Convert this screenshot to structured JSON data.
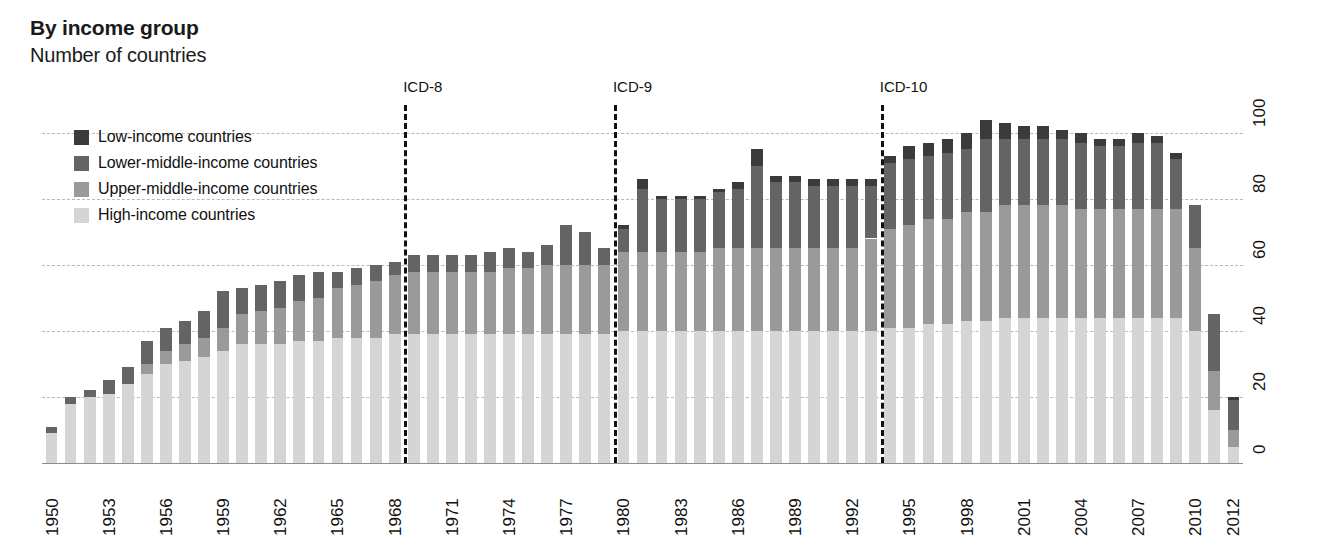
{
  "header": {
    "title": "By income group",
    "subtitle": "Number of countries"
  },
  "legend": {
    "position": "top-left-inside",
    "items": [
      {
        "label": "Low-income countries",
        "color": "#3b3b3b",
        "key": "low"
      },
      {
        "label": "Lower-middle-income countries",
        "color": "#646464",
        "key": "lower_middle"
      },
      {
        "label": "Upper-middle-income countries",
        "color": "#9a9a9a",
        "key": "upper_middle"
      },
      {
        "label": "High-income countries",
        "color": "#d5d5d5",
        "key": "high"
      }
    ]
  },
  "annotations": [
    {
      "label": "ICD-8",
      "year": 1968.5
    },
    {
      "label": "ICD-9",
      "year": 1979.5
    },
    {
      "label": "ICD-10",
      "year": 1993.5
    }
  ],
  "chart_data": {
    "type": "bar",
    "stacked": true,
    "title": "By income group",
    "subtitle": "Number of countries",
    "xlabel": "",
    "ylabel": "Number of countries",
    "ylim": [
      0,
      106
    ],
    "yticks": [
      0,
      20,
      40,
      60,
      80,
      100
    ],
    "ytick_labels": [
      "0",
      "20",
      "40",
      "60",
      "80",
      "100"
    ],
    "grid": "horizontal-dashed",
    "x_tick_step": 3,
    "x_tick_years": [
      1950,
      1953,
      1956,
      1959,
      1962,
      1965,
      1968,
      1971,
      1974,
      1977,
      1980,
      1983,
      1986,
      1989,
      1992,
      1995,
      1998,
      2001,
      2004,
      2007,
      2010,
      2012
    ],
    "categories": [
      1950,
      1951,
      1952,
      1953,
      1954,
      1955,
      1956,
      1957,
      1958,
      1959,
      1960,
      1961,
      1962,
      1963,
      1964,
      1965,
      1966,
      1967,
      1968,
      1969,
      1970,
      1971,
      1972,
      1973,
      1974,
      1975,
      1976,
      1977,
      1978,
      1979,
      1980,
      1981,
      1982,
      1983,
      1984,
      1985,
      1986,
      1987,
      1988,
      1989,
      1990,
      1991,
      1992,
      1993,
      1994,
      1995,
      1996,
      1997,
      1998,
      1999,
      2000,
      2001,
      2002,
      2003,
      2004,
      2005,
      2006,
      2007,
      2008,
      2009,
      2010,
      2011,
      2012
    ],
    "series": [
      {
        "name": "High-income countries",
        "color": "#d5d5d5",
        "values": [
          9,
          18,
          20,
          21,
          24,
          27,
          30,
          31,
          32,
          34,
          36,
          36,
          36,
          37,
          37,
          38,
          38,
          38,
          39,
          39,
          39,
          39,
          39,
          39,
          39,
          39,
          39,
          39,
          39,
          39,
          40,
          40,
          40,
          40,
          40,
          40,
          40,
          40,
          40,
          40,
          40,
          40,
          40,
          40,
          41,
          41,
          42,
          42,
          43,
          43,
          44,
          44,
          44,
          44,
          44,
          44,
          44,
          44,
          44,
          44,
          40,
          16,
          5
        ]
      },
      {
        "name": "Upper-middle-income countries",
        "color": "#9a9a9a",
        "values": [
          0,
          0,
          0,
          0,
          0,
          3,
          4,
          5,
          6,
          7,
          9,
          10,
          11,
          12,
          13,
          15,
          16,
          17,
          18,
          19,
          19,
          19,
          19,
          19,
          20,
          20,
          21,
          21,
          21,
          21,
          24,
          24,
          24,
          24,
          24,
          25,
          25,
          25,
          25,
          25,
          25,
          25,
          25,
          28,
          30,
          31,
          32,
          32,
          33,
          33,
          34,
          34,
          34,
          34,
          33,
          33,
          33,
          33,
          33,
          33,
          25,
          12,
          5
        ]
      },
      {
        "name": "Lower-middle-income countries",
        "color": "#646464",
        "values": [
          2,
          2,
          2,
          4,
          5,
          7,
          7,
          7,
          8,
          11,
          8,
          8,
          8,
          8,
          8,
          5,
          5,
          5,
          4,
          5,
          5,
          5,
          5,
          6,
          6,
          5,
          6,
          12,
          10,
          5,
          7,
          19,
          16,
          16,
          16,
          17,
          18,
          25,
          20,
          20,
          19,
          19,
          19,
          16,
          20,
          20,
          19,
          20,
          19,
          22,
          20,
          20,
          20,
          20,
          20,
          19,
          19,
          20,
          20,
          15,
          13,
          17,
          9
        ]
      },
      {
        "name": "Low-income countries",
        "color": "#3b3b3b",
        "values": [
          0,
          0,
          0,
          0,
          0,
          0,
          0,
          0,
          0,
          0,
          0,
          0,
          0,
          0,
          0,
          0,
          0,
          0,
          0,
          0,
          0,
          0,
          0,
          0,
          0,
          0,
          0,
          0,
          0,
          0,
          1,
          3,
          1,
          1,
          1,
          1,
          2,
          5,
          2,
          2,
          2,
          2,
          2,
          2,
          2,
          4,
          4,
          4,
          5,
          6,
          5,
          4,
          4,
          3,
          3,
          2,
          2,
          3,
          2,
          2,
          0,
          0,
          1
        ]
      }
    ],
    "totals": [
      11,
      20,
      22,
      25,
      29,
      37,
      41,
      43,
      46,
      52,
      53,
      54,
      54,
      57,
      58,
      58,
      59,
      60,
      61,
      63,
      63,
      63,
      63,
      64,
      65,
      64,
      66,
      72,
      70,
      65,
      72,
      86,
      81,
      81,
      81,
      83,
      85,
      95,
      87,
      87,
      86,
      86,
      86,
      86,
      93,
      96,
      97,
      98,
      100,
      104,
      103,
      102,
      102,
      101,
      100,
      98,
      98,
      100,
      99,
      94,
      78,
      45,
      20
    ]
  }
}
